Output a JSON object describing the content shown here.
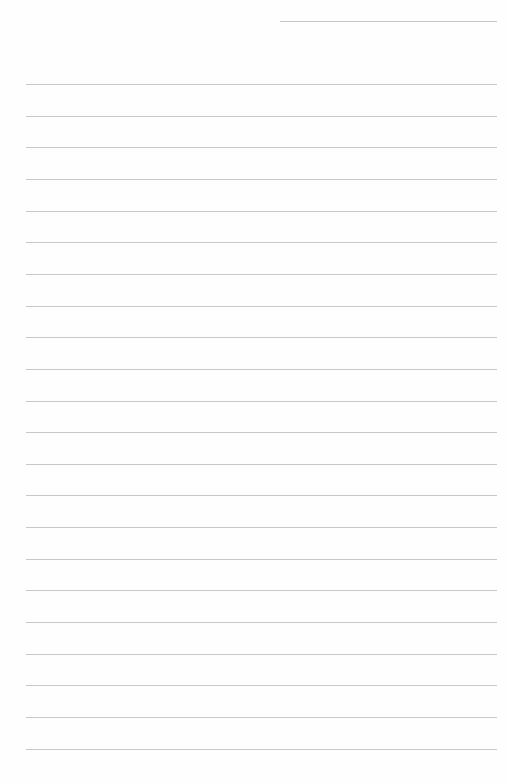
{
  "page": {
    "type": "lined-paper",
    "background": "#fefefe",
    "line_color": "#c8c8c8",
    "header_line": {
      "x": 280,
      "y": 21,
      "width": 217
    },
    "rules": {
      "count": 22,
      "start_y": 84,
      "spacing": 31.65,
      "x": 26,
      "width": 471
    }
  }
}
